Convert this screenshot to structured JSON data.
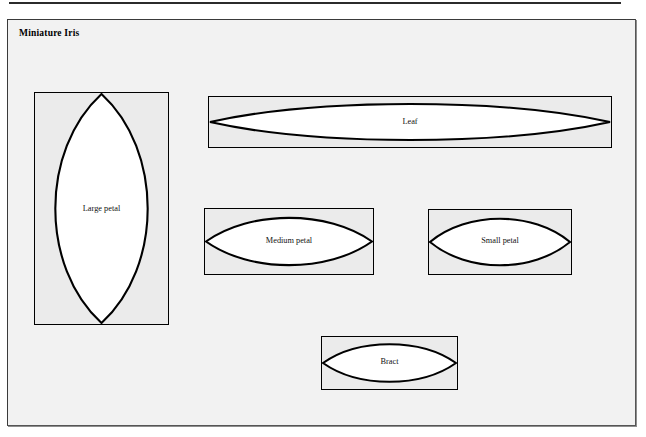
{
  "panel": {
    "title": "Miniature Iris",
    "background_color": "#f2f2f2",
    "border_color": "#3a3a3a"
  },
  "colors": {
    "shape_fill": "#ffffff",
    "shape_stroke": "#000000",
    "cell_fill": "#ebebeb",
    "text": "#111111"
  },
  "shapes": [
    {
      "id": "large-petal",
      "label": "Large petal",
      "form": "vesica-lens",
      "orientation": "vertical",
      "box": {
        "x": 26,
        "y": 72,
        "width": 135,
        "height": 233
      }
    },
    {
      "id": "leaf",
      "label": "Leaf",
      "form": "vesica-lens",
      "orientation": "horizontal",
      "box": {
        "x": 200,
        "y": 76,
        "width": 404,
        "height": 52
      }
    },
    {
      "id": "medium-petal",
      "label": "Medium petal",
      "form": "vesica-lens",
      "orientation": "horizontal",
      "box": {
        "x": 196,
        "y": 188,
        "width": 170,
        "height": 67
      }
    },
    {
      "id": "small-petal",
      "label": "Small petal",
      "form": "vesica-lens",
      "orientation": "horizontal",
      "box": {
        "x": 420,
        "y": 189,
        "width": 144,
        "height": 66
      }
    },
    {
      "id": "bract",
      "label": "Bract",
      "form": "vesica-lens",
      "orientation": "horizontal",
      "box": {
        "x": 313,
        "y": 316,
        "width": 137,
        "height": 54
      }
    }
  ]
}
